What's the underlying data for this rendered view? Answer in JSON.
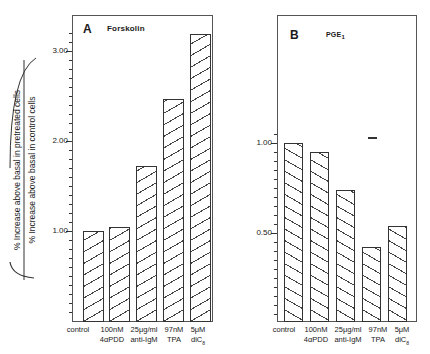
{
  "chart_data": [
    {
      "type": "bar",
      "panel": "A",
      "title": "Forskolin",
      "categories": [
        "control 100nM",
        "4αPDD",
        "25μg/ml anti-IgM",
        "97nM TPA",
        "5μM diC8"
      ],
      "category_labels": [
        {
          "line1": "control",
          "line2": ""
        },
        {
          "line1": "100nM",
          "line2": "4αPDD"
        },
        {
          "line1": "25μg/ml",
          "line2": "anti-IgM"
        },
        {
          "line1": "97nM",
          "line2": "TPA"
        },
        {
          "line1": "5μM",
          "line2": "diC",
          "sub": "8"
        }
      ],
      "values": [
        1.0,
        1.05,
        1.72,
        2.47,
        3.19
      ],
      "ylabel": "(% Increase above basal in pretreated cells / % Increase above basal in control cells)",
      "yticks": [
        1.0,
        2.0,
        3.0
      ],
      "ytick_labels": [
        "1.00",
        "2.00",
        "3.00"
      ],
      "ylim": [
        0,
        3.4
      ],
      "minor_tick_step": 0.1,
      "grid": false,
      "legend": null,
      "hatch": "forward-diagonal"
    },
    {
      "type": "bar",
      "panel": "B",
      "title": "PGE1",
      "categories": [
        "control",
        "100nM 4αPDD",
        "25μg/ml anti-IgM",
        "97nM TPA",
        "5μM diC8"
      ],
      "category_labels": [
        {
          "line1": "control",
          "line2": ""
        },
        {
          "line1": "100nM",
          "line2": "4αPDD"
        },
        {
          "line1": "25μg/ml",
          "line2": "anti-IgM"
        },
        {
          "line1": "97nM",
          "line2": "TPA"
        },
        {
          "line1": "5μM",
          "line2": "diC",
          "sub": "8"
        }
      ],
      "values": [
        1.0,
        0.95,
        0.74,
        0.42,
        0.54
      ],
      "ylabel": "",
      "yticks": [
        0.5,
        1.0
      ],
      "ytick_labels": [
        "0.50",
        "1.00"
      ],
      "ylim": [
        0,
        1.7
      ],
      "minor_tick_step": 0.05,
      "grid": false,
      "legend": null,
      "hatch": "backward-diagonal"
    }
  ],
  "panels": {
    "A": {
      "letter": "A",
      "title": "Forskolin"
    },
    "B": {
      "letter": "B",
      "title": "PGE",
      "title_sub": "1"
    }
  },
  "ylabel": {
    "numerator": "% Increase above basal in pretreated cells",
    "denominator": "% Increase above basal in control cells"
  },
  "xlabels": {
    "c0": "control",
    "c1a": "100nM",
    "c1b": "4αPDD",
    "c2a": "25μg/ml",
    "c2b": "anti-IgM",
    "c3a": "97nM",
    "c3b": "TPA",
    "c4a": "5μM",
    "c4b": "diC",
    "c4sub": "8"
  },
  "ticks": {
    "A": {
      "t1": "1.00",
      "t2": "2.00",
      "t3": "3.00"
    },
    "B": {
      "t05": "0.50",
      "t1": "1.00"
    }
  }
}
